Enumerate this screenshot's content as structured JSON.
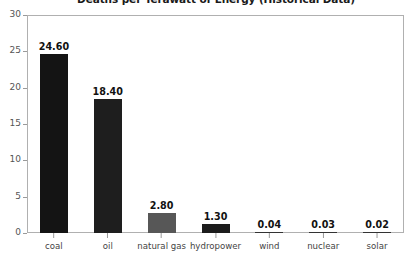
{
  "chart_data": {
    "type": "bar",
    "title": "Deaths per Terawatt of Energy (Historical Data)",
    "xlabel": "",
    "ylabel": "",
    "ylim": [
      0,
      30
    ],
    "yticks": [
      0,
      5,
      10,
      15,
      20,
      25,
      30
    ],
    "grid": false,
    "legend": false,
    "categories": [
      "coal",
      "oil",
      "natural gas",
      "hydropower",
      "wind",
      "nuclear",
      "solar"
    ],
    "values": [
      24.6,
      18.4,
      2.8,
      1.3,
      0.04,
      0.03,
      0.02
    ],
    "value_labels": [
      "24.60",
      "18.40",
      "2.80",
      "1.30",
      "0.04",
      "0.03",
      "0.02"
    ],
    "bar_colors": [
      "#141414",
      "#1e1e1e",
      "#575757",
      "#1c1c1c",
      "#333333",
      "#333333",
      "#333333"
    ]
  },
  "axis": {
    "y_tick_labels": [
      "0",
      "5",
      "10",
      "15",
      "20",
      "25",
      "30"
    ]
  },
  "colors": {
    "frame": "#b0b0b0",
    "tick": "#9a9a9a",
    "text": "#444444",
    "value_text": "#111111",
    "background": "#ffffff"
  }
}
